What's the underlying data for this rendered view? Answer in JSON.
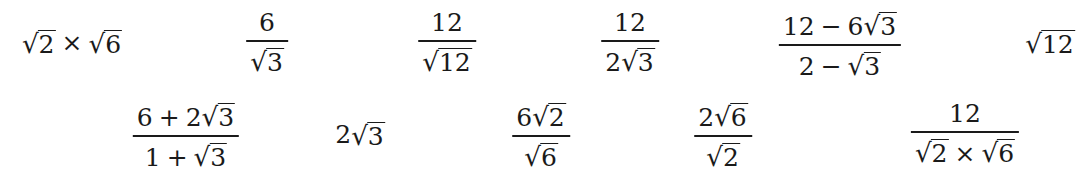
{
  "row1": [
    {
      "id": "e1",
      "type": "product",
      "left": "2",
      "operator": "×",
      "right": "6",
      "center_x": 72,
      "top": 28
    },
    {
      "id": "e2",
      "type": "fraction",
      "numerator": "6",
      "denominator_radicand": "3",
      "center_x": 267,
      "top": 10
    },
    {
      "id": "e3",
      "type": "fraction",
      "numerator": "12",
      "denominator_radicand": "12",
      "center_x": 447,
      "top": 10
    },
    {
      "id": "e4",
      "type": "fraction",
      "numerator": "12",
      "denominator_coef": "2",
      "denominator_radicand": "3",
      "center_x": 630,
      "top": 10
    },
    {
      "id": "e5",
      "type": "fraction",
      "numerator_int": "12",
      "numerator_op": "−",
      "numerator_coef": "6",
      "numerator_radicand": "3",
      "denominator_int": "2",
      "denominator_op": "−",
      "denominator_radicand": "3",
      "center_x": 840,
      "top": 10
    },
    {
      "id": "e6",
      "type": "radical",
      "radicand": "12",
      "center_x": 1050,
      "top": 28
    }
  ],
  "row2": [
    {
      "id": "e7",
      "type": "fraction",
      "numerator_int": "6",
      "numerator_op": "+",
      "numerator_coef": "2",
      "numerator_radicand": "3",
      "denominator_int": "1",
      "denominator_op": "+",
      "denominator_radicand": "3",
      "center_x": 186,
      "top": 101
    },
    {
      "id": "e8",
      "type": "coef-radical",
      "coef": "2",
      "radicand": "3",
      "center_x": 360,
      "top": 120
    },
    {
      "id": "e9",
      "type": "fraction",
      "numerator_coef": "6",
      "numerator_radicand": "2",
      "denominator_radicand": "6",
      "center_x": 541,
      "top": 101
    },
    {
      "id": "e10",
      "type": "fraction",
      "numerator_coef": "2",
      "numerator_radicand": "6",
      "denominator_radicand": "2",
      "center_x": 723,
      "top": 101
    },
    {
      "id": "e11",
      "type": "fraction",
      "numerator": "12",
      "denominator_left": "2",
      "denominator_operator": "×",
      "denominator_right": "6",
      "center_x": 965,
      "top": 101
    }
  ],
  "symbols": {
    "radical": "√"
  }
}
